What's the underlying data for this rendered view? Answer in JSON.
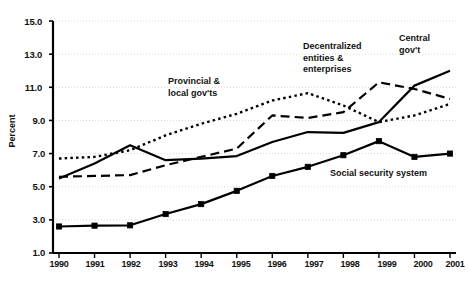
{
  "chart_data": {
    "type": "line",
    "title": "",
    "xlabel": "",
    "ylabel": "Percent",
    "categories": [
      "1990",
      "1991",
      "1992",
      "1993",
      "1994",
      "1995",
      "1996",
      "1997",
      "1998",
      "1999",
      "2000",
      "2001"
    ],
    "x": [
      1990,
      1991,
      1992,
      1993,
      1994,
      1995,
      1996,
      1997,
      1998,
      1999,
      2000,
      2001
    ],
    "ylim": [
      1.0,
      15.0
    ],
    "xlim": [
      1990,
      2001
    ],
    "yticks": [
      "1.0",
      "3.0",
      "5.0",
      "7.0",
      "9.0",
      "11.0",
      "13.0",
      "15.0"
    ],
    "ytick_values": [
      1.0,
      3.0,
      5.0,
      7.0,
      9.0,
      11.0,
      13.0,
      15.0
    ],
    "grid": "horizontal-dotted",
    "legend": "inline-annotations",
    "series": [
      {
        "name": "Central gov't",
        "style": "solid",
        "marker": "none",
        "color": "#000000",
        "values": [
          5.5,
          6.4,
          7.5,
          6.6,
          6.7,
          6.85,
          7.7,
          8.3,
          8.25,
          8.9,
          11.1,
          12.0
        ]
      },
      {
        "name": "Provincial & local gov'ts",
        "style": "dotted",
        "marker": "none",
        "color": "#000000",
        "values": [
          6.7,
          6.8,
          7.2,
          8.1,
          8.8,
          9.4,
          10.2,
          10.65,
          9.9,
          8.9,
          9.3,
          10.0
        ]
      },
      {
        "name": "Decentralized entities & enterprises",
        "style": "dashed",
        "marker": "none",
        "color": "#000000",
        "values": [
          5.6,
          5.65,
          5.7,
          6.3,
          6.8,
          7.3,
          9.3,
          9.15,
          9.5,
          11.3,
          10.9,
          10.3
        ]
      },
      {
        "name": "Social security system",
        "style": "solid",
        "marker": "square",
        "color": "#000000",
        "values": [
          2.6,
          2.65,
          2.67,
          3.35,
          3.95,
          4.75,
          5.65,
          6.2,
          6.9,
          7.75,
          6.8,
          7.0
        ]
      }
    ],
    "annotations": [
      {
        "text": "Provincial &\nlocal gov'ts",
        "series": "Provincial & local gov'ts"
      },
      {
        "text": "Decentralized\nentities &\nenterprises",
        "series": "Decentralized entities & enterprises"
      },
      {
        "text": "Central\ngov't",
        "series": "Central gov't"
      },
      {
        "text": "Social security system",
        "series": "Social security system"
      }
    ]
  },
  "axis": {
    "y_title": "Percent",
    "y_ticks": [
      "15.0",
      "13.0",
      "11.0",
      "9.0",
      "7.0",
      "5.0",
      "3.0",
      "1.0"
    ],
    "x_ticks": [
      "1990",
      "1991",
      "1992",
      "1993",
      "1994",
      "1995",
      "1996",
      "1997",
      "1998",
      "1999",
      "2000",
      "2001"
    ]
  },
  "annotations": {
    "provincial_line1": "Provincial &",
    "provincial_line2": "local gov'ts",
    "decentralized_line1": "Decentralized",
    "decentralized_line2": "entities &",
    "decentralized_line3": "enterprises",
    "central_line1": "Central",
    "central_line2": "gov't",
    "social": "Social security system"
  },
  "colors": {
    "ink": "#000000",
    "grid": "#cfcfcf",
    "background": "#ffffff"
  }
}
